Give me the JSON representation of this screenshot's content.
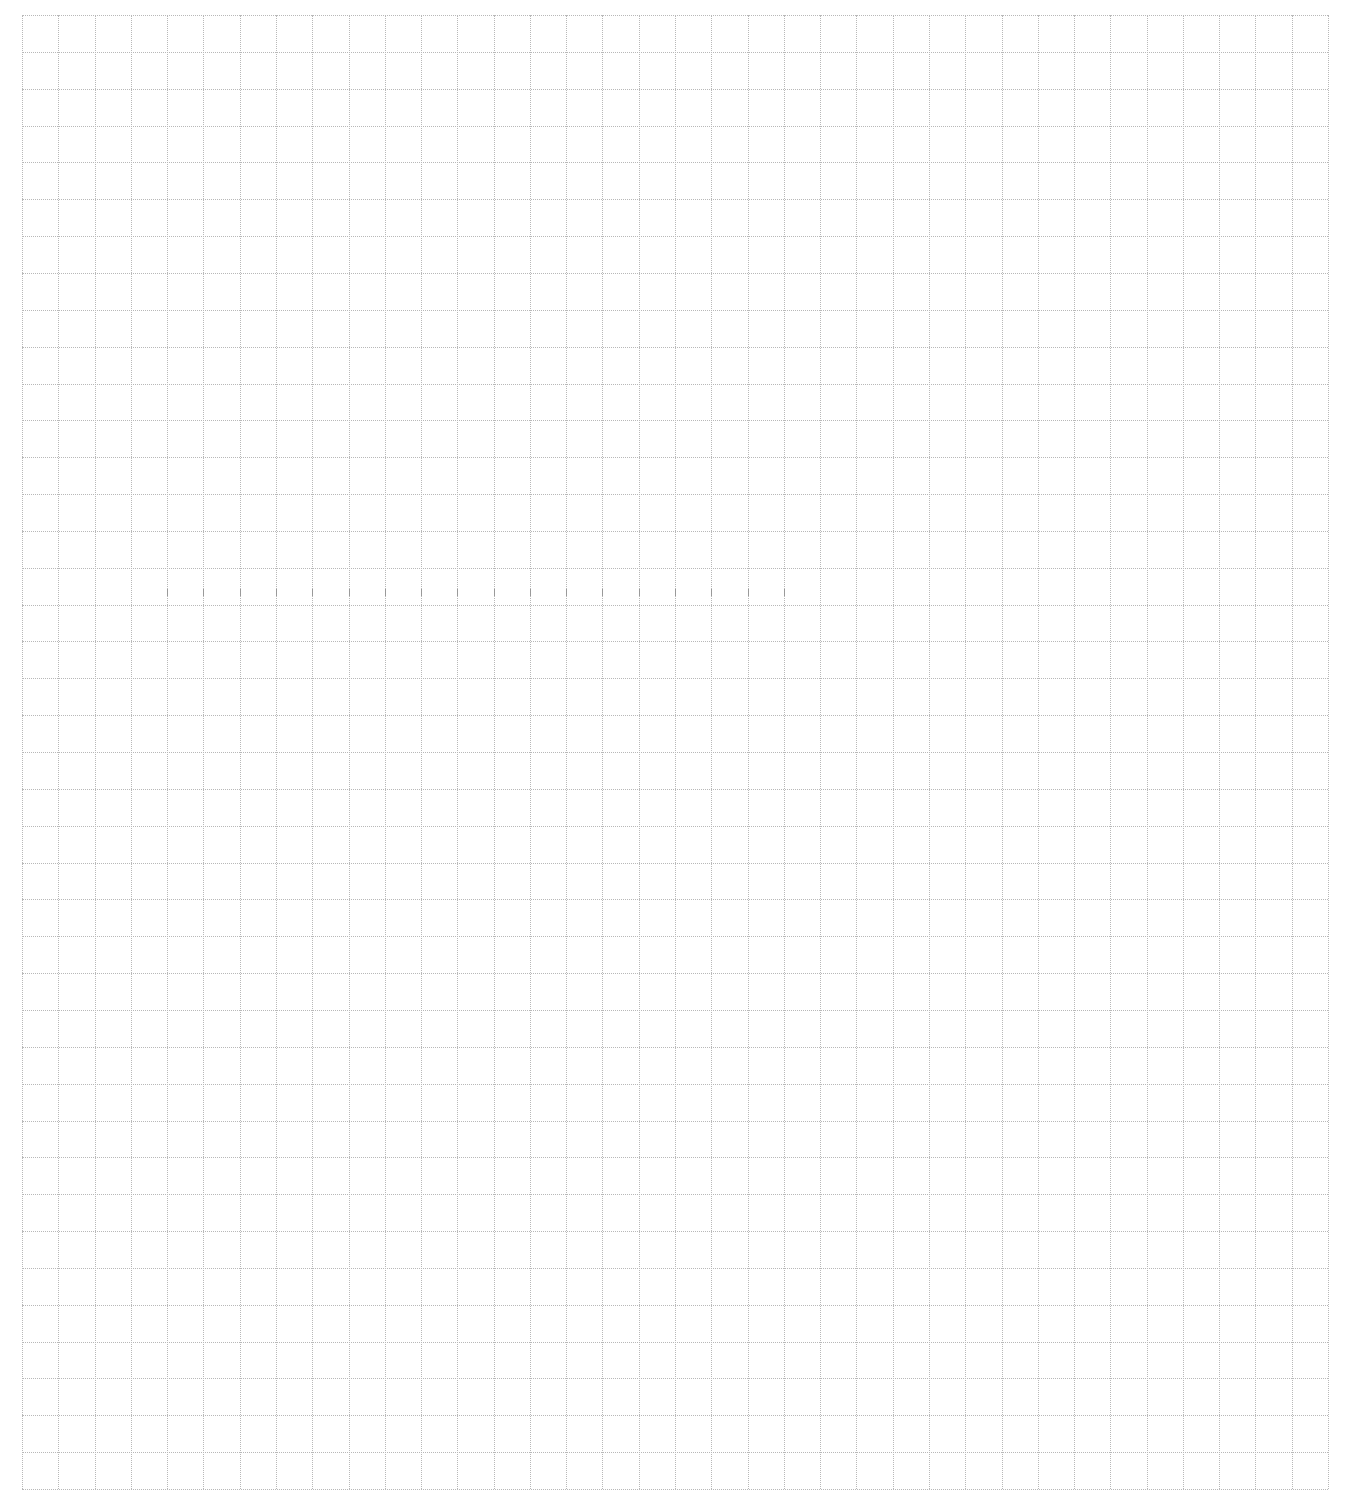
{
  "page": {
    "type": "blank graph paper",
    "background": "#ffffff",
    "line_color": "#b8b8b8",
    "line_style": "dotted"
  },
  "grid": {
    "columns": 36,
    "rows": 40,
    "left": 22,
    "top": 15,
    "width": 1306,
    "height": 1474
  },
  "ticks": {
    "row_index": 16,
    "count": 18,
    "color": "#9a9a9a"
  }
}
